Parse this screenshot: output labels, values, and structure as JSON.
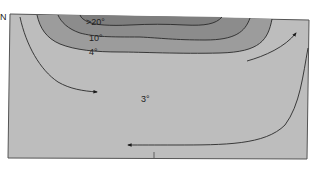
{
  "diagram": {
    "direction_label": "N",
    "isotherms": [
      {
        "label": ">20°",
        "value": 20
      },
      {
        "label": "10°",
        "value": 10
      },
      {
        "label": "4°",
        "value": 4
      }
    ],
    "deep_water_label": "3°",
    "colors": {
      "background": "#ffffff",
      "deep_water": "#bdbdbd",
      "band_4": "#9a9a9a",
      "band_10": "#8a8a8a",
      "band_20": "#7c7c7c",
      "line": "#2a2a2a"
    }
  }
}
